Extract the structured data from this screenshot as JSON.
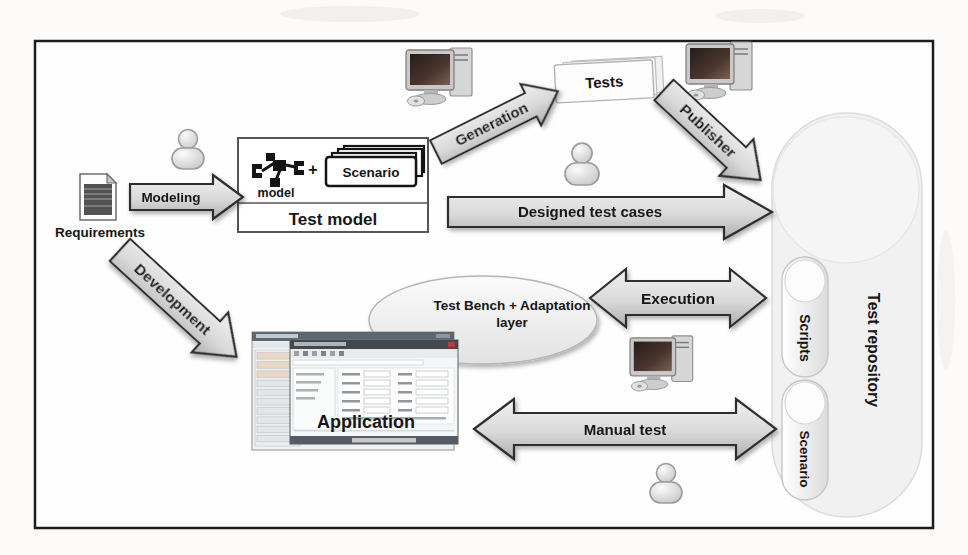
{
  "diagram": {
    "requirements": {
      "label": "Requirements"
    },
    "modeling_arrow": {
      "label": "Modeling"
    },
    "development_arrow": {
      "label": "Development"
    },
    "generation_arrow": {
      "label": "Generation"
    },
    "publisher_arrow": {
      "label": "Publisher"
    },
    "designed_arrow": {
      "label": "Designed test cases"
    },
    "execution_arrow": {
      "label": "Execution"
    },
    "manual_arrow": {
      "label": "Manual test"
    },
    "test_model_box": {
      "model_caption": "model",
      "plus_sign": "+",
      "scenario_card": "Scenario",
      "title": "Test model"
    },
    "tests_stack": {
      "label": "Tests"
    },
    "test_bench_bubble": {
      "line1": "Test Bench + Adaptation",
      "line2": "layer"
    },
    "application_window": {
      "label": "Application"
    },
    "repository": {
      "title": "Test repository",
      "scripts_pill": "Scripts",
      "scenario_pill": "Scenario"
    }
  },
  "colors": {
    "frame_stroke": "#1c1c1c",
    "arrow_stroke": "#2e2e2e",
    "arrow_fill_light": "#efefef",
    "arrow_fill_dark": "#aeaeae",
    "label_text": "#161616",
    "repository_fill": "#f1f1f1",
    "screen_dark": "#241d1a"
  }
}
